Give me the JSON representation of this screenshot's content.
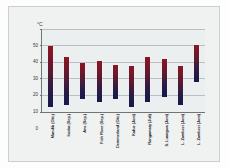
{
  "chart_data": {
    "type": "bar",
    "subtype": "floating-range-bar",
    "title": "",
    "xlabel": "",
    "ylabel": "°C",
    "unit_label": "°C",
    "ylim": [
      0,
      50
    ],
    "ytick_labels": [
      "0",
      "10",
      "20",
      "30",
      "40",
      "50"
    ],
    "ytick_values": [
      0,
      10,
      20,
      30,
      40,
      50
    ],
    "grid": true,
    "legend": false,
    "legend_position": "none",
    "categories": [
      "Mandib (Okt.)",
      "Itoska (Sep.)",
      "Ans (Sep.)",
      "Fish River (Sep.)",
      "Demmerland (Okt.)",
      "Kafue (Juni)",
      "Rangamaty (Juli)",
      "S. Luangwa (Juni)",
      "L. Zambezi (Juni)",
      "L. Zambezi (Juni)"
    ],
    "series": [
      {
        "name": "Minimum",
        "values": [
          3,
          4,
          8,
          6,
          8,
          3,
          6,
          9,
          4,
          18
        ]
      },
      {
        "name": "Maximum",
        "values": [
          40,
          33,
          29.5,
          30.5,
          28.5,
          27.5,
          33,
          32,
          28,
          40.5
        ]
      }
    ],
    "bar_color_top": "#8c1526",
    "bar_color_bottom": "#16194a",
    "plot_background": "#eceff0",
    "grid_color": "#b9c0c0",
    "axis_color": "#6d7575",
    "frame_background": "#f0f2f2"
  }
}
